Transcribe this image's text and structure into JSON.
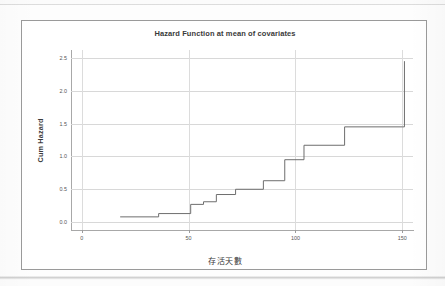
{
  "page": {
    "background_color": "#fdfdfd",
    "frame_border_color": "#9a9a9a"
  },
  "chart_data": {
    "type": "line",
    "subtype": "step",
    "title": "Hazard Function at mean of covariates",
    "xlabel": "存活天數",
    "ylabel": "Cum Hazard",
    "xlim": [
      -5,
      155
    ],
    "ylim": [
      -0.12,
      2.62
    ],
    "xticks": [
      0,
      50,
      100,
      150
    ],
    "xtick_labels": [
      "0",
      "50",
      "100",
      "150"
    ],
    "yticks": [
      0.0,
      0.5,
      1.0,
      1.5,
      2.0,
      2.5
    ],
    "ytick_labels": [
      "0.0",
      "0.5",
      "1.0",
      "1.5",
      "2.0",
      "2.5"
    ],
    "grid": true,
    "grid_color": "#d8d8d8",
    "legend": null,
    "line_color": "#6e6e6e",
    "line_width": 1,
    "series": [
      {
        "name": "Cumulative hazard",
        "x": [
          18,
          36,
          51,
          57,
          63,
          72,
          85,
          95,
          104,
          123,
          150,
          151
        ],
        "y": [
          0.08,
          0.13,
          0.27,
          0.31,
          0.42,
          0.5,
          0.63,
          0.95,
          1.17,
          1.45,
          1.45,
          2.45
        ]
      }
    ]
  }
}
